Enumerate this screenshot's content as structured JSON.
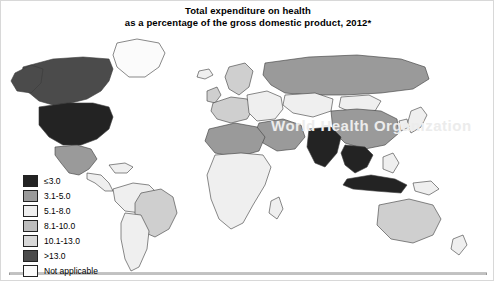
{
  "title": {
    "line1": "Total expenditure on health",
    "line2": "as a percentage of the gross domestic product, 2012*"
  },
  "watermark": "World Health Organization",
  "legend": {
    "items": [
      {
        "label": "≤3.0",
        "color": "#232323"
      },
      {
        "label": "3.1-5.0",
        "color": "#9a9a9a"
      },
      {
        "label": "5.1-8.0",
        "color": "#eeeeee"
      },
      {
        "label": "8.1-10.0",
        "color": "#bdbdbd"
      },
      {
        "label": "10.1-13.0",
        "color": "#d8d8d8"
      },
      {
        "label": ">13.0",
        "color": "#4b4b4b"
      },
      {
        "label": "Not applicable",
        "color": "#fbfbfb"
      }
    ]
  },
  "map": {
    "projection": "world-robinson-like",
    "ocean_color": "#ffffff",
    "border_color": "#333333",
    "regions": [
      {
        "name": "greenland",
        "class": "c-na"
      },
      {
        "name": "canada",
        "class": "c-dark"
      },
      {
        "name": "alaska",
        "class": "c-dark"
      },
      {
        "name": "united-states",
        "class": "c-darkest"
      },
      {
        "name": "mexico",
        "class": "c-mid"
      },
      {
        "name": "central-america",
        "class": "c-light"
      },
      {
        "name": "caribbean",
        "class": "c-light"
      },
      {
        "name": "brazil",
        "class": "c-lightgrey"
      },
      {
        "name": "south-america-rest",
        "class": "c-light"
      },
      {
        "name": "western-europe",
        "class": "c-lightgrey"
      },
      {
        "name": "eastern-europe",
        "class": "c-light"
      },
      {
        "name": "russia",
        "class": "c-mid"
      },
      {
        "name": "north-africa",
        "class": "c-mid"
      },
      {
        "name": "sub-saharan-africa",
        "class": "c-light"
      },
      {
        "name": "middle-east",
        "class": "c-mid"
      },
      {
        "name": "india",
        "class": "c-darkest"
      },
      {
        "name": "china",
        "class": "c-mid"
      },
      {
        "name": "southeast-asia",
        "class": "c-darkest"
      },
      {
        "name": "indonesia",
        "class": "c-darkest"
      },
      {
        "name": "australia",
        "class": "c-lightgrey"
      },
      {
        "name": "japan",
        "class": "c-light"
      },
      {
        "name": "antarctica-edge",
        "class": "c-na"
      }
    ]
  }
}
